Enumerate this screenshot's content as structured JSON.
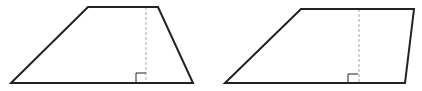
{
  "diagram": {
    "colors": {
      "outline": "#222222",
      "dashed": "#aaaaaa",
      "background": "#ffffff"
    },
    "shapes": [
      {
        "name": "trapezoid-left",
        "points": "88,7 158,7 193,83 11,83",
        "height_line": {
          "x": 146,
          "y1": 7,
          "y2": 83
        },
        "right_angle": {
          "x": 136,
          "y": 73,
          "size": 10
        }
      },
      {
        "name": "trapezoid-right",
        "points": "301,9 414,9 405,83 225,83",
        "height_line": {
          "x": 359,
          "y1": 9,
          "y2": 83
        },
        "right_angle": {
          "x": 348,
          "y": 74,
          "size": 10
        }
      }
    ]
  }
}
